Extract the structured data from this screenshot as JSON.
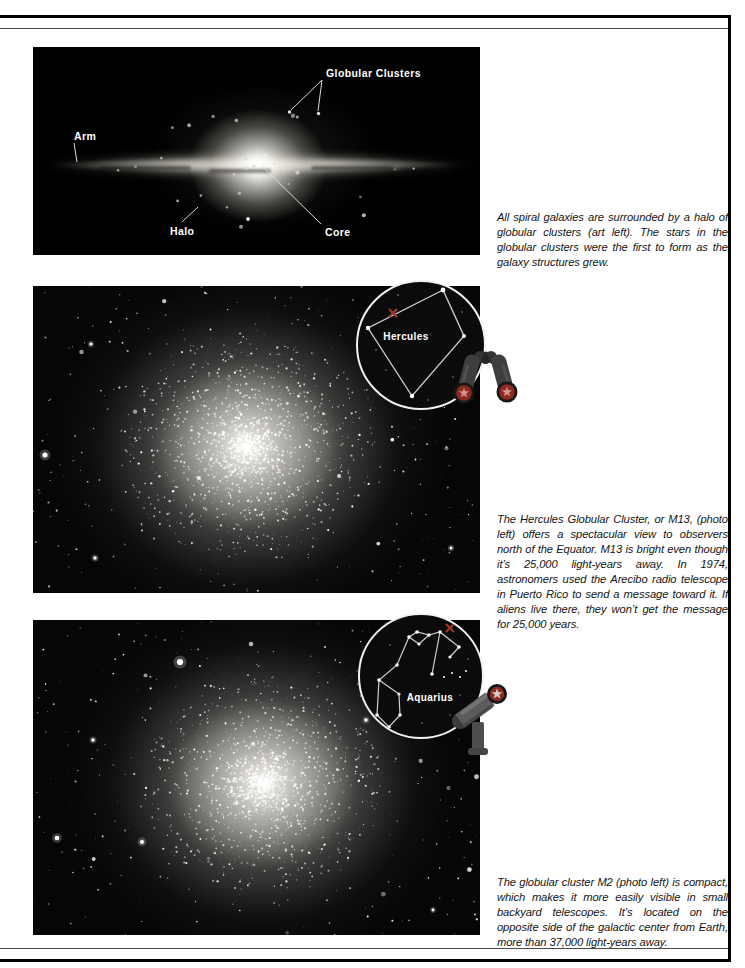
{
  "page": {
    "type": "book-page",
    "topic": "Globular clusters",
    "background": "#ffffff",
    "rule_color": "#000000"
  },
  "panels": [
    {
      "id": "galaxy-art",
      "kind": "illustration",
      "labels": {
        "globular_clusters": "Globular Clusters",
        "arm": "Arm",
        "halo": "Halo",
        "core": "Core"
      },
      "caption": "All spiral galaxies are surrounded by a halo of globular clusters (art left). The stars in the globular clusters were the first to form as the galaxy structures grew."
    },
    {
      "id": "m13-photo",
      "kind": "photo",
      "subject": "M13 Hercules Globular Cluster",
      "inset": {
        "constellation": "Hercules",
        "marker": "x",
        "icon": "binoculars"
      },
      "caption": "The Hercules Globular Cluster, or M13, (photo left) offers a spectacular view to observers north of the Equator. M13 is bright even though it’s 25,000 light-years away. In 1974, astronomers used the Arecibo radio telescope in Puerto Rico to send a message toward it. If aliens live there, they won’t get the message for 25,000 years."
    },
    {
      "id": "m2-photo",
      "kind": "photo",
      "subject": "Globular cluster M2",
      "inset": {
        "constellation": "Aquarius",
        "marker": "x",
        "icon": "telescope"
      },
      "caption": "The globular cluster M2 (photo left) is compact, which makes it more easily visible in small backyard telescopes. It’s located on the opposite side of the galactic center from Earth, more than 37,000 light-years away."
    }
  ],
  "colors": {
    "marker_red": "#9e3a2c",
    "lens_red": "#8e2a22",
    "lens_star_pink": "#d8958d",
    "lens_star_light": "#d6cfc9",
    "icon_gray": "#4a4a4a",
    "constellation_line": "#cfd0d2"
  }
}
